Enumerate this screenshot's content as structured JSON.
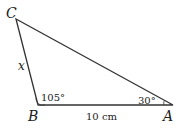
{
  "diagram": {
    "type": "triangle",
    "vertices": {
      "A": {
        "label": "A",
        "angle": "30°"
      },
      "B": {
        "label": "B",
        "angle": "105°"
      },
      "C": {
        "label": "C"
      }
    },
    "sides": {
      "AB": {
        "label": "10 cm"
      },
      "BC": {
        "label": "x"
      }
    },
    "colors": {
      "line": "#333333",
      "text": "#222222"
    }
  }
}
